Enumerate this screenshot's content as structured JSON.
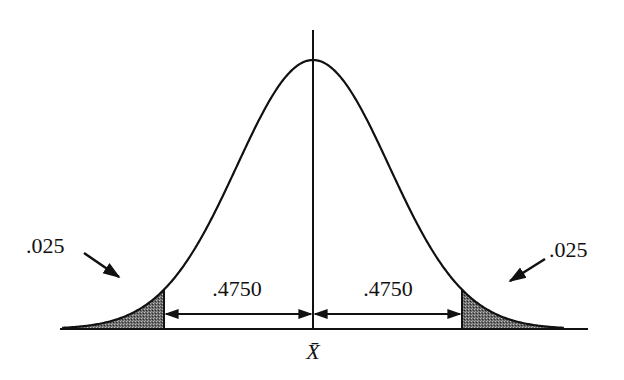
{
  "figure": {
    "type": "normal-distribution-diagram",
    "mean_label": "X̄",
    "tail_area_left": ".025",
    "tail_area_right": ".025",
    "central_area_left": ".4750",
    "central_area_right": ".4750",
    "colors": {
      "ink": "#111111",
      "shade": "#555555",
      "background": "#ffffff"
    }
  },
  "chart_data": {
    "type": "area",
    "title": "",
    "distribution": "normal",
    "mean": 0,
    "sd": 1,
    "critical_z": [
      -1.96,
      1.96
    ],
    "x_range": [
      -3.3,
      3.3
    ],
    "shaded_regions": [
      {
        "from": -3.3,
        "to": -1.96,
        "area": 0.025,
        "label": ".025"
      },
      {
        "from": 1.96,
        "to": 3.3,
        "area": 0.025,
        "label": ".025"
      }
    ],
    "interval_annotations": [
      {
        "from": -1.96,
        "to": 0,
        "area": 0.475,
        "label": ".4750"
      },
      {
        "from": 0,
        "to": 1.96,
        "area": 0.475,
        "label": ".4750"
      }
    ],
    "center_label": "X̄",
    "xlabel": "",
    "ylabel": ""
  }
}
